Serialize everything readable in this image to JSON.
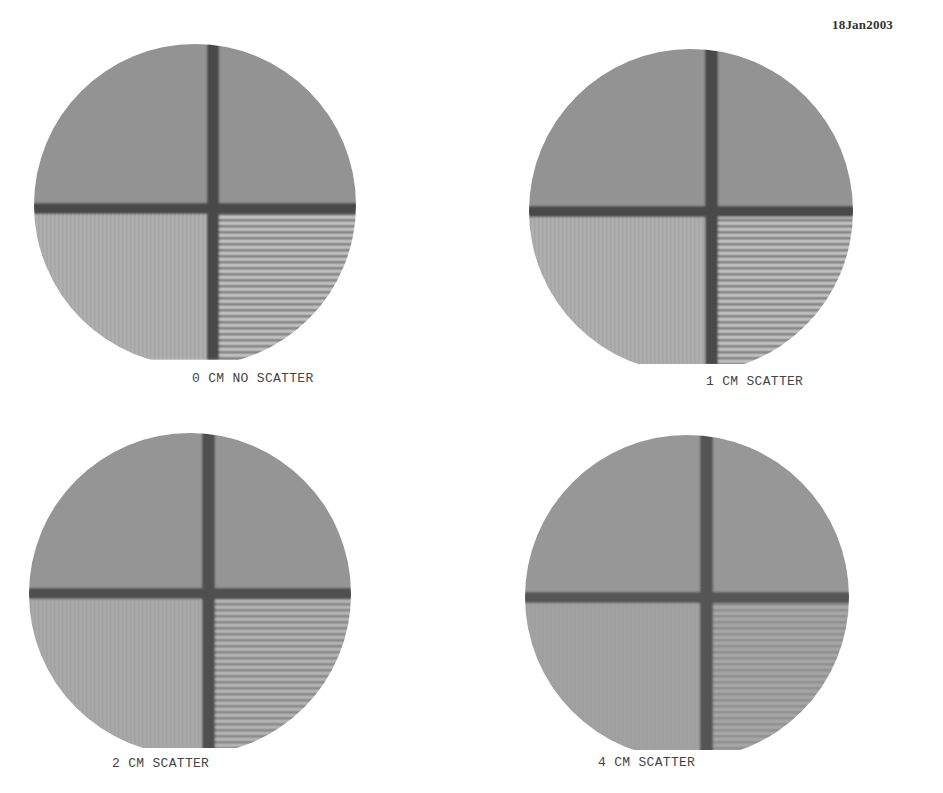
{
  "header": {
    "date": "18Jan2003"
  },
  "colors": {
    "background": "#ffffff",
    "field_gray": "#8f8f8f",
    "bar_dark": "#4a4a4a",
    "stripe_light": "#bdbdbd",
    "label_text": "#444444"
  },
  "panels": [
    {
      "id": "p0",
      "label": "0 CM NO SCATTER",
      "scatter_cm": 0,
      "stripe_contrast": "high"
    },
    {
      "id": "p1",
      "label": "1 CM SCATTER",
      "scatter_cm": 1,
      "stripe_contrast": "high"
    },
    {
      "id": "p2",
      "label": "2 CM SCATTER",
      "scatter_cm": 2,
      "stripe_contrast": "medium"
    },
    {
      "id": "p3",
      "label": "4 CM SCATTER",
      "scatter_cm": 4,
      "stripe_contrast": "low"
    }
  ],
  "quadrants": {
    "upper_left": "uniform",
    "upper_right": "uniform",
    "lower_left": "vertical-lines",
    "lower_right": "horizontal-lines"
  }
}
